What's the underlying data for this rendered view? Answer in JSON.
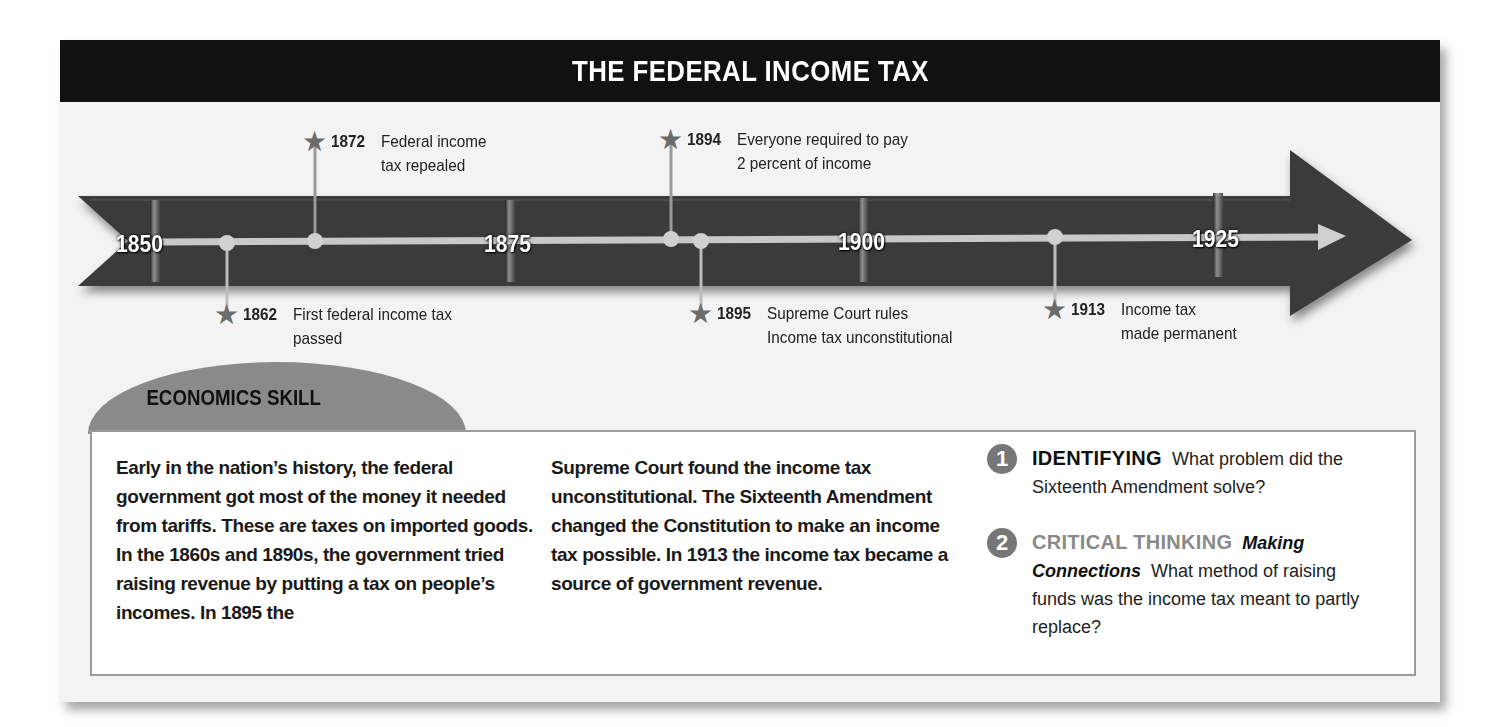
{
  "title": "THE FEDERAL INCOME TAX",
  "timeline": {
    "year_markers": [
      "1850",
      "1875",
      "1900",
      "1925"
    ],
    "events": [
      {
        "year": "1862",
        "text": "First federal income tax\npassed",
        "position": "below"
      },
      {
        "year": "1872",
        "text": "Federal income\ntax repealed",
        "position": "above"
      },
      {
        "year": "1894",
        "text": "Everyone required to pay\n2 percent of income",
        "position": "above"
      },
      {
        "year": "1895",
        "text": "Supreme Court rules\nIncome tax unconstitutional",
        "position": "below"
      },
      {
        "year": "1913",
        "text": "Income tax\nmade permanent",
        "position": "below"
      }
    ]
  },
  "skill": {
    "tab_label": "ECONOMICS SKILL",
    "column1": "Early in the nation’s history, the federal government got most of the money it needed from tariffs. These are taxes on imported goods. In the 1860s and 1890s, the government tried raising revenue by putting a tax on people’s incomes. In 1895 the",
    "column2": "Supreme Court found the income tax unconstitutional. The Sixteenth Amendment changed the Constitution to make an income tax possible. In 1913 the income tax became a source of government revenue.",
    "questions": [
      {
        "number": "1",
        "heading": "IDENTIFYING",
        "subheading": "",
        "text": "What problem did the Sixteenth Amendment solve?"
      },
      {
        "number": "2",
        "heading": "CRITICAL THINKING",
        "subheading": "Making Connections",
        "text": "What method of raising funds was the income tax meant to partly replace?"
      }
    ]
  },
  "colors": {
    "title_bar": "#111111",
    "arrow": "#3a3a3a",
    "track": "#c8c8c8",
    "star": "#6b6b6b",
    "tab": "#8a8a8a",
    "critical_thinking": "#8a8a8a"
  }
}
